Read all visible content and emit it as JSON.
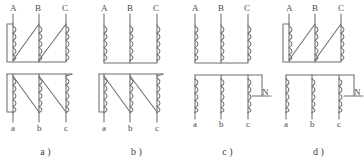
{
  "figure": {
    "type": "diagram",
    "background_color": "#ffffff",
    "line_color": "#6e6e6e",
    "text_color": "#4a4a4a",
    "panel_count": 4
  },
  "panels": [
    {
      "id": "panel-a",
      "caption": "a )",
      "hv": {
        "connection": "delta",
        "terminals": [
          "A",
          "B",
          "C"
        ]
      },
      "lv": {
        "connection": "delta",
        "terminals": [
          "a",
          "b",
          "c"
        ]
      },
      "neutral": null
    },
    {
      "id": "panel-b",
      "caption": "b )",
      "hv": {
        "connection": "wye",
        "terminals": [
          "A",
          "B",
          "C"
        ]
      },
      "lv": {
        "connection": "delta",
        "terminals": [
          "a",
          "b",
          "c"
        ]
      },
      "neutral": null
    },
    {
      "id": "panel-c",
      "caption": "c )",
      "hv": {
        "connection": "wye",
        "terminals": [
          "A",
          "B",
          "C"
        ]
      },
      "lv": {
        "connection": "wye",
        "terminals": [
          "a",
          "b",
          "c"
        ]
      },
      "neutral": "N"
    },
    {
      "id": "panel-d",
      "caption": "d )",
      "hv": {
        "connection": "delta",
        "terminals": [
          "A",
          "B",
          "C"
        ]
      },
      "lv": {
        "connection": "wye",
        "terminals": [
          "a",
          "b",
          "c"
        ]
      },
      "neutral": "N"
    }
  ]
}
